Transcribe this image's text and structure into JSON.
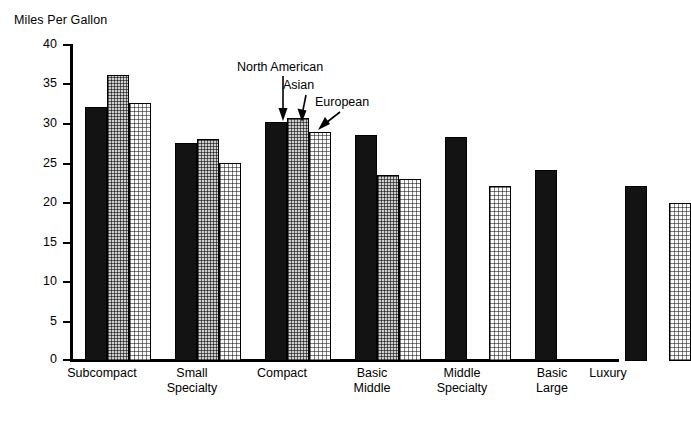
{
  "chart_data": {
    "type": "bar",
    "title": "Miles Per Gallon",
    "xlabel": "",
    "ylabel": "Miles Per Gallon",
    "ylim": [
      0,
      40
    ],
    "ytick_step": 5,
    "yticks": [
      "40",
      "35",
      "30",
      "25",
      "20",
      "15",
      "10",
      "5",
      "0"
    ],
    "grid": false,
    "legend": "inline-annotations",
    "categories": [
      "Subcompact",
      "Small\nSpecialty",
      "Compact",
      "Basic\nMiddle",
      "Middle\nSpecialty",
      "Basic\nLarge",
      "Luxury"
    ],
    "series": [
      {
        "name": "North American",
        "color": "#131313",
        "values": [
          32.2,
          27.6,
          30.3,
          28.6,
          28.4,
          24.2,
          22.2
        ]
      },
      {
        "name": "Asian",
        "color": "#cfcfcf",
        "values": [
          36.2,
          28.1,
          30.7,
          23.6,
          null,
          null,
          null
        ]
      },
      {
        "name": "European",
        "color": "#fbfbfb",
        "values": [
          32.6,
          25.1,
          29.0,
          23.1,
          22.1,
          null,
          20.0
        ]
      }
    ],
    "annotations": [
      {
        "text": "North American",
        "target_series": "North American",
        "target_category": "Compact"
      },
      {
        "text": "Asian",
        "target_series": "Asian",
        "target_category": "Compact"
      },
      {
        "text": "European",
        "target_series": "European",
        "target_category": "Compact"
      }
    ]
  },
  "axis": {
    "tick_40": "40",
    "tick_35": "35",
    "tick_30": "30",
    "tick_25": "25",
    "tick_20": "20",
    "tick_15": "15",
    "tick_10": "10",
    "tick_5": "5",
    "tick_0": "0"
  },
  "categories": {
    "c0": "Subcompact",
    "c1": "Small\nSpecialty",
    "c2": "Compact",
    "c3": "Basic\nMiddle",
    "c4": "Middle\nSpecialty",
    "c5": "Basic\nLarge",
    "c6": "Luxury"
  },
  "annotations": {
    "north_american": "North American",
    "asian": "Asian",
    "european": "European"
  },
  "title": "Miles Per Gallon"
}
